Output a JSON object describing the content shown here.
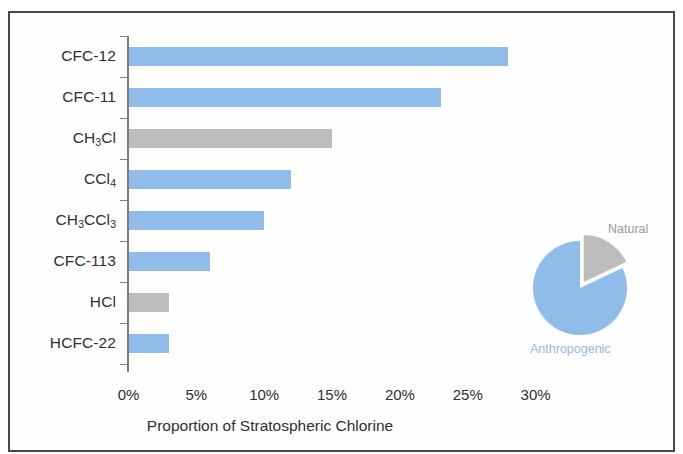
{
  "chart_data": {
    "type": "bar",
    "orientation": "horizontal",
    "title": "",
    "xlabel": "Proportion of Stratospheric Chlorine",
    "ylabel": "",
    "xlim": [
      0,
      32
    ],
    "xticks": [
      "0%",
      "5%",
      "10%",
      "15%",
      "20%",
      "25%",
      "30%"
    ],
    "xtick_values": [
      0,
      5,
      10,
      15,
      20,
      25,
      30
    ],
    "grid": false,
    "legend": "none",
    "categories": [
      "CFC-12",
      "CFC-11",
      "CH3Cl",
      "CCl4",
      "CH3CCl3",
      "CFC-113",
      "HCl",
      "HCFC-22"
    ],
    "values": [
      28,
      23,
      15,
      12,
      10,
      6,
      3,
      3
    ],
    "bars": [
      {
        "label_html": "CFC-12",
        "value": 28,
        "source": "anthropogenic",
        "color": "#8fbce8"
      },
      {
        "label_html": "CFC-11",
        "value": 23,
        "source": "anthropogenic",
        "color": "#8fbce8"
      },
      {
        "label_html": "CH<sub>3</sub>Cl",
        "value": 15,
        "source": "natural",
        "color": "#bdbdbd"
      },
      {
        "label_html": "CCl<sub>4</sub>",
        "value": 12,
        "source": "anthropogenic",
        "color": "#8fbce8"
      },
      {
        "label_html": "CH<sub>3</sub>CCl<sub>3</sub>",
        "value": 10,
        "source": "anthropogenic",
        "color": "#8fbce8"
      },
      {
        "label_html": "CFC-113",
        "value": 6,
        "source": "anthropogenic",
        "color": "#8fbce8"
      },
      {
        "label_html": "HCl",
        "value": 3,
        "source": "natural",
        "color": "#bdbdbd"
      },
      {
        "label_html": "HCFC-22",
        "value": 3,
        "source": "anthropogenic",
        "color": "#8fbce8"
      }
    ],
    "inset_pie": {
      "type": "pie",
      "labels": [
        "Natural",
        "Anthropogenic"
      ],
      "values": [
        18,
        82
      ],
      "colors": [
        "#bdbdbd",
        "#8fbce8"
      ],
      "exploded_slice": "Natural"
    }
  },
  "axis": {
    "x_title": "Proportion of Stratospheric Chlorine"
  },
  "pie": {
    "natural_label": "Natural",
    "anthropogenic_label": "Anthropogenic"
  },
  "colors": {
    "anthropogenic": "#8fbce8",
    "natural": "#bdbdbd",
    "axis": "#7d7d7d",
    "text": "#2f2f2f",
    "frame": "#494949"
  }
}
